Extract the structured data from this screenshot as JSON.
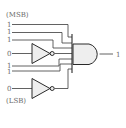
{
  "diagram": {
    "type": "logic-circuit",
    "labels": {
      "msb": "(MSB)",
      "lsb": "(LSB)"
    },
    "inputs": [
      {
        "value": "1",
        "inverted": false
      },
      {
        "value": "1",
        "inverted": false
      },
      {
        "value": "1",
        "inverted": false
      },
      {
        "value": "0",
        "inverted": true
      },
      {
        "value": "1",
        "inverted": false
      },
      {
        "value": "1",
        "inverted": false
      },
      {
        "value": "0",
        "inverted": true
      }
    ],
    "gate": "AND",
    "output": {
      "value": "1"
    },
    "colors": {
      "line": "#3a3a3a",
      "gate_fill": "#eeeeee",
      "text": "#6b6b6b"
    }
  }
}
